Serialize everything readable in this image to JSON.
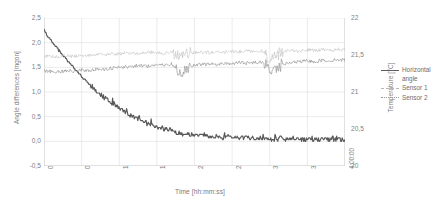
{
  "chart_data": {
    "type": "line",
    "title": "",
    "xlabel": "Time [hh:mm:ss]",
    "ylabel": "Angle differences [mgon]",
    "y2label": "Temperature [°C]",
    "grid": true,
    "legend_position": "right",
    "xlim": [
      "0:00:00",
      "4:00:00"
    ],
    "ylim": [
      -0.5,
      2.5
    ],
    "y2lim": [
      20,
      22
    ],
    "xticks": [
      "0:00:00",
      "0:30:00",
      "1:00:00",
      "1:30:00",
      "2:00:00",
      "2:30:00",
      "3:00:00",
      "3:30:00",
      "4:00:00"
    ],
    "yticks": [
      "2,5",
      "2,0",
      "1,5",
      "1,0",
      "0,5",
      "0,0",
      "-0,5"
    ],
    "y2ticks": [
      "22",
      "21,5",
      "21",
      "20,5",
      "20"
    ],
    "colors": {
      "horizontal_angle": "#585858",
      "sensor1": "#bdbdbd",
      "sensor2": "#8a8a8a"
    },
    "series": [
      {
        "name": "Horizontal angle",
        "axis": "left",
        "style": "solid",
        "x": [
          0,
          0.02,
          0.05,
          0.08,
          0.11,
          0.14,
          0.17,
          0.2,
          0.24,
          0.28,
          0.32,
          0.36,
          0.4,
          0.45,
          0.5,
          0.55,
          0.6,
          0.66,
          0.72,
          0.78,
          0.85,
          0.92,
          1.0,
          1.08,
          1.16,
          1.25,
          1.34,
          1.43,
          1.52,
          1.62,
          1.72,
          1.82,
          1.92,
          2.02,
          2.15,
          2.3,
          2.45,
          2.6,
          2.8,
          3.0,
          3.2,
          3.4,
          3.6,
          3.8,
          4.0
        ],
        "values": [
          2.28,
          2.2,
          2.12,
          2.08,
          2.02,
          1.96,
          1.9,
          1.84,
          1.77,
          1.7,
          1.63,
          1.56,
          1.49,
          1.4,
          1.32,
          1.24,
          1.16,
          1.07,
          0.99,
          0.91,
          0.82,
          0.74,
          0.66,
          0.58,
          0.51,
          0.44,
          0.38,
          0.33,
          0.28,
          0.24,
          0.2,
          0.17,
          0.15,
          0.13,
          0.11,
          0.09,
          0.08,
          0.07,
          0.06,
          0.05,
          0.05,
          0.04,
          0.04,
          0.04,
          0.03
        ]
      },
      {
        "name": "Sensor 1",
        "axis": "right",
        "style": "dashed",
        "x": [
          0,
          0.1,
          0.2,
          0.3,
          0.4,
          0.5,
          0.6,
          0.7,
          0.8,
          0.9,
          1.0,
          1.1,
          1.2,
          1.3,
          1.4,
          1.5,
          1.6,
          1.7,
          1.8,
          1.9,
          2.0,
          2.1,
          2.2,
          2.3,
          2.4,
          2.5,
          2.6,
          2.7,
          2.8,
          2.9,
          3.0,
          3.1,
          3.2,
          3.3,
          3.4,
          3.5,
          3.6,
          3.7,
          3.8,
          3.9,
          4.0
        ],
        "values": [
          21.48,
          21.48,
          21.47,
          21.49,
          21.48,
          21.5,
          21.49,
          21.51,
          21.5,
          21.52,
          21.51,
          21.53,
          21.52,
          21.53,
          21.54,
          21.53,
          21.52,
          21.54,
          21.48,
          21.52,
          21.53,
          21.54,
          21.53,
          21.55,
          21.54,
          21.55,
          21.54,
          21.56,
          21.55,
          21.56,
          21.44,
          21.52,
          21.55,
          21.56,
          21.55,
          21.57,
          21.56,
          21.57,
          21.56,
          21.58,
          21.57
        ]
      },
      {
        "name": "Sensor 2",
        "axis": "right",
        "style": "dotted",
        "x": [
          0,
          0.1,
          0.2,
          0.3,
          0.4,
          0.5,
          0.6,
          0.7,
          0.8,
          0.9,
          1.0,
          1.1,
          1.2,
          1.3,
          1.4,
          1.5,
          1.6,
          1.7,
          1.8,
          1.9,
          2.0,
          2.1,
          2.2,
          2.3,
          2.4,
          2.5,
          2.6,
          2.7,
          2.8,
          2.9,
          3.0,
          3.1,
          3.2,
          3.3,
          3.4,
          3.5,
          3.6,
          3.7,
          3.8,
          3.9,
          4.0
        ],
        "values": [
          21.28,
          21.28,
          21.27,
          21.29,
          21.28,
          21.3,
          21.29,
          21.31,
          21.3,
          21.32,
          21.33,
          21.34,
          21.35,
          21.36,
          21.35,
          21.37,
          21.36,
          21.38,
          21.25,
          21.33,
          21.36,
          21.37,
          21.38,
          21.37,
          21.39,
          21.38,
          21.4,
          21.39,
          21.4,
          21.41,
          21.3,
          21.34,
          21.38,
          21.4,
          21.41,
          21.42,
          21.41,
          21.43,
          21.42,
          21.44,
          21.43
        ]
      }
    ]
  },
  "legend": {
    "items": [
      {
        "label_line1": "Horizontal",
        "label_line2": "angle"
      },
      {
        "label_line1": "Sensor 1",
        "label_line2": ""
      },
      {
        "label_line1": "Sensor 2",
        "label_line2": ""
      }
    ]
  }
}
